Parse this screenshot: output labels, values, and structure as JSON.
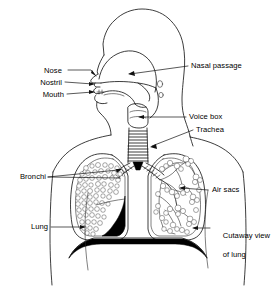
{
  "figure": {
    "style": "black-and-white line drawing",
    "background_color": "#ffffff",
    "ink_color": "#111111"
  },
  "labels": {
    "nose": "Nose",
    "nostril": "Nostril",
    "mouth": "Mouth",
    "nasal_passage": "Nasal passage",
    "voice_box": "Voice box",
    "trachea": "Trachea",
    "bronchi": "Bronchi",
    "air_sacs": "Air sacs",
    "lung": "Lung",
    "cutaway_line1": "Cutaway view",
    "cutaway_line2": "of lung"
  },
  "parts": [
    {
      "id": "nose",
      "label": "Nose",
      "side": "left",
      "x": 44,
      "y": 67
    },
    {
      "id": "nostril",
      "label": "Nostril",
      "side": "left",
      "x": 36,
      "y": 79
    },
    {
      "id": "mouth",
      "label": "Mouth",
      "side": "left",
      "x": 39,
      "y": 91
    },
    {
      "id": "nasal-passage",
      "label": "Nasal passage",
      "side": "right",
      "x": 190,
      "y": 62
    },
    {
      "id": "voice-box",
      "label": "Voice box",
      "side": "right",
      "x": 188,
      "y": 113
    },
    {
      "id": "trachea",
      "label": "Trachea",
      "side": "right",
      "x": 195,
      "y": 126
    },
    {
      "id": "bronchi",
      "label": "Bronchi",
      "side": "left",
      "x": 14,
      "y": 173
    },
    {
      "id": "air-sacs",
      "label": "Air sacs",
      "side": "right",
      "x": 211,
      "y": 186
    },
    {
      "id": "lung",
      "label": "Lung",
      "side": "left",
      "x": 28,
      "y": 223
    },
    {
      "id": "cutaway",
      "label": "Cutaway view of lung",
      "side": "right",
      "x": 213,
      "y": 223
    }
  ]
}
